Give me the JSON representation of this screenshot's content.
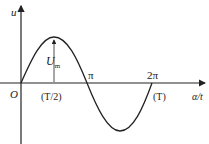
{
  "diagram": {
    "type": "sine-wave",
    "y_axis_label": "u",
    "x_axis_label": "α/t",
    "origin_label": "O",
    "amplitude_label": "U",
    "amplitude_subscript": "m",
    "ticks": [
      {
        "label": "π",
        "position": "half-period"
      },
      {
        "label": "2π",
        "position": "full-period"
      }
    ],
    "time_labels": [
      "(T/2)",
      "(T)"
    ],
    "colors": {
      "curve": "#222222",
      "axes": "#222222",
      "background": "#ffffff"
    }
  }
}
